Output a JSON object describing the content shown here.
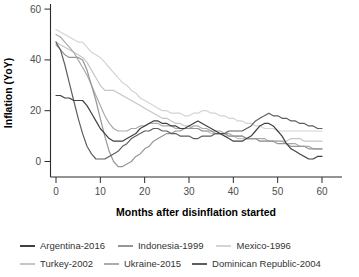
{
  "chart_data": {
    "type": "line",
    "title": "",
    "xlabel": "Months after disinflation started",
    "ylabel": "Inflation (YoY)",
    "xlim": [
      0,
      60
    ],
    "ylim": [
      -3,
      60
    ],
    "x_ticks": [
      0,
      10,
      20,
      30,
      40,
      50,
      60
    ],
    "y_ticks": [
      0,
      20,
      40,
      60
    ],
    "grid": false,
    "legend_position": "bottom",
    "x": [
      0,
      1,
      2,
      3,
      4,
      5,
      6,
      7,
      8,
      9,
      10,
      11,
      12,
      13,
      14,
      15,
      16,
      17,
      18,
      19,
      20,
      21,
      22,
      23,
      24,
      25,
      26,
      27,
      28,
      29,
      30,
      31,
      32,
      33,
      34,
      35,
      36,
      37,
      38,
      39,
      40,
      41,
      42,
      43,
      44,
      45,
      46,
      47,
      48,
      49,
      50,
      51,
      52,
      53,
      54,
      55,
      56,
      57,
      58,
      59,
      60
    ],
    "series": [
      {
        "name": "Argentina-2016",
        "color": "#404040",
        "values": [
          26,
          26,
          25,
          25,
          24,
          24,
          24,
          22,
          19,
          16,
          13,
          11,
          9,
          8,
          8,
          8,
          9,
          10,
          11,
          13,
          14,
          15,
          16,
          16,
          15,
          15,
          14,
          14,
          13,
          13,
          14,
          15,
          16,
          15,
          14,
          13,
          12,
          11,
          10,
          9,
          8,
          8,
          8,
          9,
          10,
          12,
          14,
          15,
          15,
          14,
          12,
          10,
          7,
          5,
          4,
          3,
          2,
          1,
          1,
          2,
          2
        ]
      },
      {
        "name": "Indonesia-1999",
        "color": "#969696",
        "values": [
          46,
          44,
          42,
          41,
          41,
          41,
          40,
          36,
          30,
          24,
          17,
          10,
          4,
          0,
          -2,
          -2,
          -1,
          0,
          2,
          3,
          5,
          6,
          8,
          9,
          10,
          11,
          11,
          12,
          12,
          13,
          13,
          13,
          13,
          12,
          12,
          12,
          11,
          11,
          11,
          10,
          10,
          10,
          10,
          9,
          9,
          9,
          8,
          8,
          8,
          8,
          7,
          7,
          7,
          6,
          6,
          6,
          6,
          5,
          5,
          5,
          5
        ]
      },
      {
        "name": "Mexico-1996",
        "color": "#d4d4d4",
        "values": [
          52,
          51,
          50,
          49,
          48,
          47,
          47,
          45,
          43,
          42,
          41,
          39,
          37,
          35,
          33,
          31,
          30,
          28,
          27,
          25,
          24,
          23,
          22,
          21,
          20,
          20,
          19,
          19,
          19,
          18,
          18,
          19,
          19,
          20,
          20,
          19,
          19,
          18,
          18,
          17,
          17,
          16,
          16,
          15,
          15,
          14,
          14,
          13,
          13,
          13,
          12,
          12,
          12,
          12,
          12,
          12,
          12,
          12,
          12,
          12,
          12
        ]
      },
      {
        "name": "Turkey-2002",
        "color": "#c6c6c6",
        "values": [
          47,
          46,
          45,
          44,
          43,
          42,
          41,
          39,
          36,
          33,
          30,
          28,
          28,
          28,
          27,
          26,
          25,
          24,
          23,
          22,
          21,
          20,
          19,
          18,
          17,
          17,
          16,
          15,
          15,
          14,
          14,
          13,
          13,
          12,
          12,
          11,
          11,
          11,
          10,
          10,
          10,
          9,
          9,
          9,
          9,
          9,
          8,
          8,
          8,
          8,
          8,
          8,
          8,
          9,
          9,
          9,
          8,
          8,
          8,
          8,
          8
        ]
      },
      {
        "name": "Ukraine-2015",
        "color": "#ababab",
        "values": [
          50,
          49,
          47,
          45,
          43,
          40,
          37,
          34,
          30,
          26,
          22,
          18,
          15,
          13,
          12,
          12,
          12,
          13,
          13,
          14,
          14,
          15,
          15,
          15,
          14,
          14,
          14,
          13,
          13,
          13,
          13,
          14,
          14,
          13,
          13,
          12,
          12,
          12,
          11,
          11,
          10,
          10,
          10,
          9,
          9,
          9,
          9,
          9,
          8,
          8,
          8,
          8,
          7,
          7,
          7,
          6,
          6,
          6,
          5,
          5,
          5
        ]
      },
      {
        "name": "Dominican Republic-2004",
        "color": "#5e5e5e",
        "values": [
          47,
          44,
          38,
          31,
          24,
          17,
          11,
          6,
          3,
          1,
          1,
          1,
          2,
          3,
          4,
          6,
          7,
          9,
          10,
          11,
          12,
          12,
          13,
          13,
          12,
          12,
          11,
          11,
          10,
          10,
          10,
          9,
          9,
          10,
          10,
          10,
          11,
          11,
          11,
          12,
          12,
          12,
          12,
          13,
          14,
          16,
          17,
          18,
          19,
          18,
          18,
          17,
          17,
          16,
          16,
          15,
          15,
          14,
          14,
          13,
          13
        ]
      }
    ],
    "legend_rows": [
      [
        "Argentina-2016",
        "Indonesia-1999",
        "Mexico-1996"
      ],
      [
        "Turkey-2002",
        "Ukraine-2015",
        "Dominican Republic-2004"
      ]
    ]
  }
}
